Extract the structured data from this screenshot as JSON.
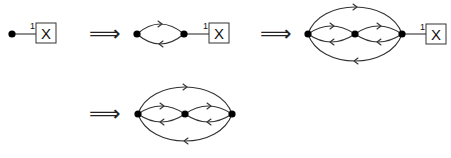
{
  "diagram": {
    "implies_symbol": "⟹",
    "box_label": "X",
    "port_label": "1",
    "steps": [
      {
        "id": "step-1",
        "vertices": 1,
        "description": "single vertex connected to box X via port 1"
      },
      {
        "id": "step-2",
        "vertices": 2,
        "description": "two vertices joined by a loop (upper arrow right, lower arrow left), right vertex connected to box X via port 1"
      },
      {
        "id": "step-3",
        "vertices": 3,
        "description": "three vertices with two inner loops and one outer loop, right vertex connected to box X via port 1"
      },
      {
        "id": "step-4",
        "vertices": 3,
        "description": "three vertices with two inner loops and one outer loop, no box"
      }
    ],
    "colors": {
      "stroke": "#333333",
      "vertex": "#000000",
      "background": "#ffffff"
    }
  }
}
